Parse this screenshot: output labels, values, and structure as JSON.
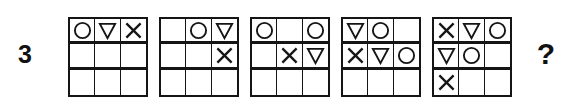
{
  "item": {
    "number": "3",
    "answer_placeholder": "?"
  },
  "symbols": {
    "circle": "circle-outline",
    "triangle": "triangle-down-outline",
    "cross": "cross-x",
    "empty": "blank"
  },
  "colors": {
    "ink": "#151515",
    "paper": "#ffffff"
  },
  "grids": [
    {
      "name": "grid-1",
      "rows": [
        [
          "circle",
          "triangle",
          "cross"
        ],
        [
          "empty",
          "empty",
          "empty"
        ],
        [
          "empty",
          "empty",
          "empty"
        ]
      ]
    },
    {
      "name": "grid-2",
      "rows": [
        [
          "empty",
          "circle",
          "triangle"
        ],
        [
          "empty",
          "empty",
          "cross"
        ],
        [
          "empty",
          "empty",
          "empty"
        ]
      ]
    },
    {
      "name": "grid-3",
      "rows": [
        [
          "circle",
          "empty",
          "circle"
        ],
        [
          "empty",
          "cross",
          "triangle"
        ],
        [
          "empty",
          "empty",
          "empty"
        ]
      ]
    },
    {
      "name": "grid-4",
      "rows": [
        [
          "triangle",
          "circle",
          "empty"
        ],
        [
          "cross",
          "triangle",
          "circle"
        ],
        [
          "empty",
          "empty",
          "empty"
        ]
      ]
    },
    {
      "name": "grid-5",
      "rows": [
        [
          "cross",
          "triangle",
          "circle"
        ],
        [
          "triangle",
          "circle",
          "empty"
        ],
        [
          "cross",
          "empty",
          "empty"
        ]
      ]
    }
  ]
}
